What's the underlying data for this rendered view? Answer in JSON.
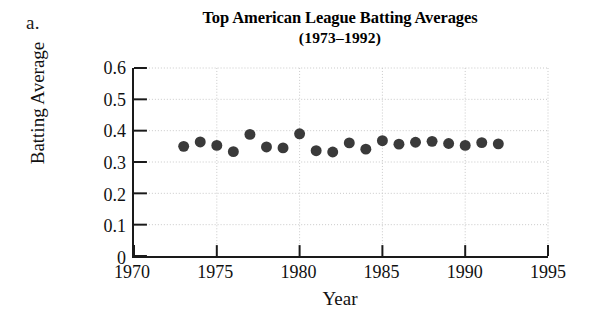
{
  "part_label": "a.",
  "chart_data": {
    "type": "scatter",
    "title": "Top American League Batting Averages",
    "subtitle": "(1973–1992)",
    "xlabel": "Year",
    "ylabel": "Batting Average",
    "xlim": [
      1970,
      1995
    ],
    "ylim": [
      0,
      0.6
    ],
    "xticks": [
      1970,
      1975,
      1980,
      1985,
      1990,
      1995
    ],
    "xtick_labels": [
      "1970",
      "1975",
      "1980",
      "1985",
      "1990",
      "1995"
    ],
    "yticks": [
      0,
      0.1,
      0.2,
      0.3,
      0.4,
      0.5,
      0.6
    ],
    "ytick_labels": [
      "0",
      "0.1",
      "0.2",
      "0.3",
      "0.4",
      "0.5",
      "0.6"
    ],
    "grid": true,
    "legend": "none",
    "marker": "filled-circle",
    "marker_color": "#3a3a3a",
    "marker_size": 11,
    "x": [
      1973,
      1974,
      1975,
      1976,
      1977,
      1978,
      1979,
      1980,
      1981,
      1982,
      1983,
      1984,
      1985,
      1986,
      1987,
      1988,
      1989,
      1990,
      1991,
      1992
    ],
    "values": [
      0.35,
      0.364,
      0.353,
      0.333,
      0.388,
      0.348,
      0.345,
      0.39,
      0.336,
      0.332,
      0.361,
      0.341,
      0.368,
      0.357,
      0.363,
      0.366,
      0.359,
      0.353,
      0.362,
      0.358
    ]
  },
  "colors": {
    "axis": "#1a1a1a",
    "grid": "#c9c9c9",
    "marker": "#3a3a3a",
    "background": "#ffffff",
    "text": "#111111"
  }
}
